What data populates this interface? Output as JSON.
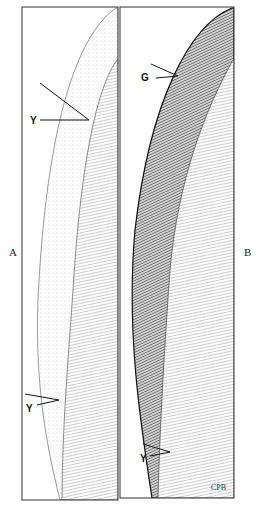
{
  "figure": {
    "panels": [
      {
        "id": "A",
        "label": "A",
        "callouts": [
          {
            "label": "Y",
            "position": "upper"
          },
          {
            "label": "Y",
            "position": "lower"
          }
        ]
      },
      {
        "id": "B",
        "label": "B",
        "callouts": [
          {
            "label": "G",
            "position": "upper"
          },
          {
            "label": "Y",
            "position": "lower"
          }
        ]
      }
    ],
    "signature": "CPB",
    "colors": {
      "ink": "#1a1a1a",
      "paper": "#ffffff",
      "stipple": "#8a8a8a"
    }
  }
}
